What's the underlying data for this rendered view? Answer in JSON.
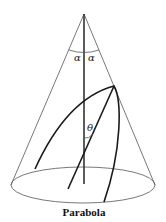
{
  "figure": {
    "caption": "Parabola",
    "labels": {
      "alpha_left": "α",
      "alpha_right": "α",
      "theta": "θ"
    },
    "colors": {
      "background": "#ffffff",
      "lines": "#1a1a1a",
      "cone_outline": "#555555"
    }
  }
}
